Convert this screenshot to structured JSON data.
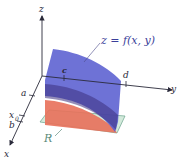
{
  "diagram": {
    "surface_label": "z = f(x, y)",
    "region_label": "R",
    "axes": {
      "x": "x",
      "y": "y",
      "z": "z"
    },
    "tick_labels": {
      "a": "a",
      "b": "b",
      "x0": "x",
      "x0_sub": "0",
      "c": "c",
      "d": "d"
    },
    "colors": {
      "surface": "#5a5fd0",
      "cross_section": "#e86a4a",
      "slab": "#4a3a8a",
      "region": "#cfe8d8",
      "axis": "#2a2a3a"
    }
  }
}
